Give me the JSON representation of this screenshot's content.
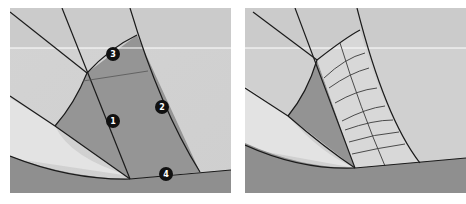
{
  "figure": {
    "panels": [
      {
        "id": "left",
        "description": "Surface patches with numbered boundary edges",
        "labels": [
          {
            "number": "1",
            "x": 103,
            "y": 113
          },
          {
            "number": "2",
            "x": 162,
            "y": 99
          },
          {
            "number": "3",
            "x": 113,
            "y": 46
          },
          {
            "number": "4",
            "x": 166,
            "y": 173
          }
        ]
      },
      {
        "id": "right",
        "description": "Surface patch with generated isoparametric grid"
      }
    ],
    "colors": {
      "background_light": "#d9d9d9",
      "background_mid": "#c4c4c4",
      "patch_dark": "#8c8c8c",
      "patch_fill": "#9a9a9a",
      "edge_line": "#1a1a1a",
      "grid_line": "#3a3a3a",
      "highlight_line": "#ffffff",
      "badge_fill": "#111111",
      "badge_text": "#ffffff"
    }
  }
}
